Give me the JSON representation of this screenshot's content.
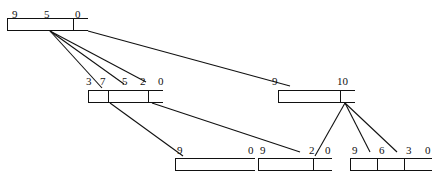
{
  "diagram": {
    "type": "b-tree-index-diagram",
    "title": "",
    "canvas": {
      "width": 439,
      "height": 182
    },
    "colors": {
      "line": "#111111",
      "background": "#ffffff",
      "node_fill": "#ffffff"
    },
    "nodes": [
      {
        "id": "root",
        "name": "root-node",
        "level": 0,
        "x": 7,
        "y": 18,
        "width": 81,
        "height": 13,
        "cell_widths": [
          66,
          15
        ],
        "labels": [
          {
            "text": "9",
            "x": 12,
            "y": 4
          },
          {
            "text": "5",
            "x": 44,
            "y": 4
          },
          {
            "text": "0",
            "x": 75,
            "y": 4
          }
        ]
      },
      {
        "id": "mid-left",
        "name": "mid-left-node",
        "level": 1,
        "x": 88,
        "y": 90,
        "width": 75,
        "height": 13,
        "cell_widths": [
          20,
          40,
          15
        ],
        "labels": [
          {
            "text": "3",
            "x": 86,
            "y": 76
          },
          {
            "text": "7",
            "x": 100,
            "y": 76
          },
          {
            "text": "5",
            "x": 122,
            "y": 76
          },
          {
            "text": "2",
            "x": 140,
            "y": 76
          },
          {
            "text": "0",
            "x": 158,
            "y": 76
          }
        ]
      },
      {
        "id": "mid-right",
        "name": "mid-right-node",
        "level": 1,
        "x": 278,
        "y": 90,
        "width": 77,
        "height": 13,
        "cell_widths": [
          62,
          15
        ],
        "labels": [
          {
            "text": "9",
            "x": 272,
            "y": 76
          },
          {
            "text": "10",
            "x": 337,
            "y": 76
          }
        ]
      },
      {
        "id": "leaf-1",
        "name": "leaf-node-1",
        "level": 2,
        "x": 175,
        "y": 158,
        "width": 80,
        "height": 13,
        "cell_widths": [
          80
        ],
        "labels": [
          {
            "text": "9",
            "x": 177,
            "y": 145
          },
          {
            "text": "0",
            "x": 248,
            "y": 145
          }
        ]
      },
      {
        "id": "leaf-2",
        "name": "leaf-node-2",
        "level": 2,
        "x": 258,
        "y": 158,
        "width": 74,
        "height": 13,
        "cell_widths": [
          55,
          19
        ],
        "labels": [
          {
            "text": "9",
            "x": 260,
            "y": 145
          },
          {
            "text": "2",
            "x": 309,
            "y": 145
          },
          {
            "text": "0",
            "x": 325,
            "y": 145
          }
        ]
      },
      {
        "id": "leaf-3",
        "name": "leaf-node-3",
        "level": 2,
        "x": 350,
        "y": 158,
        "width": 82,
        "height": 13,
        "cell_widths": [
          27,
          27,
          28
        ],
        "labels": [
          {
            "text": "9",
            "x": 352,
            "y": 145
          },
          {
            "text": "6",
            "x": 379,
            "y": 145
          },
          {
            "text": "3",
            "x": 406,
            "y": 145
          },
          {
            "text": "0",
            "x": 425,
            "y": 145
          }
        ]
      }
    ],
    "edges": [
      {
        "name": "edge-root-to-midleft-a",
        "x1": 50,
        "y1": 31,
        "x2": 102,
        "y2": 88
      },
      {
        "name": "edge-root-to-midleft-b",
        "x1": 50,
        "y1": 31,
        "x2": 124,
        "y2": 84
      },
      {
        "name": "edge-root-to-midleft-c",
        "x1": 50,
        "y1": 31,
        "x2": 146,
        "y2": 82
      },
      {
        "name": "edge-root-to-midright",
        "x1": 88,
        "y1": 31,
        "x2": 290,
        "y2": 86
      },
      {
        "name": "edge-midleft-to-leaf1",
        "x1": 110,
        "y1": 103,
        "x2": 183,
        "y2": 156
      },
      {
        "name": "edge-midleft-to-leaf2",
        "x1": 152,
        "y1": 103,
        "x2": 300,
        "y2": 152
      },
      {
        "name": "edge-midright-to-leaf2",
        "x1": 345,
        "y1": 103,
        "x2": 315,
        "y2": 156
      },
      {
        "name": "edge-midright-to-leaf3a",
        "x1": 345,
        "y1": 103,
        "x2": 370,
        "y2": 152
      },
      {
        "name": "edge-midright-to-leaf3b",
        "x1": 345,
        "y1": 103,
        "x2": 397,
        "y2": 152
      }
    ]
  }
}
